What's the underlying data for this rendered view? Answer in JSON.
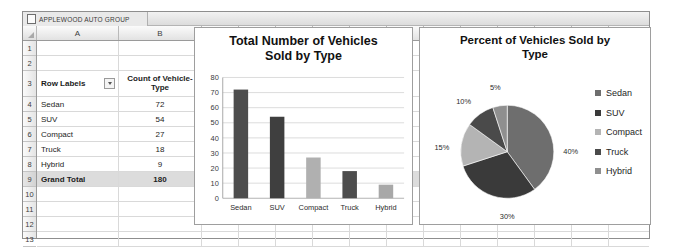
{
  "workbook": {
    "sheet_tab": {
      "label": "APPLEWOOD AUTO GROUP",
      "icon": "worksheet-icon"
    },
    "column_headers": [
      "A",
      "B",
      "C",
      "D",
      "E",
      "F",
      "G",
      "H",
      "I",
      "J",
      "K",
      "L",
      "M"
    ],
    "row_numbers": [
      "1",
      "2",
      "3",
      "4",
      "5",
      "6",
      "7",
      "8",
      "9",
      "10",
      "11",
      "12",
      "13"
    ],
    "pivot_table": {
      "header_row_number": "3",
      "col_a_header": "Row Labels",
      "col_a_filter": "filter-dropdown-icon",
      "col_b_header_line1": "Count of Vehicle-",
      "col_b_header_line2": "Type",
      "rows": [
        {
          "row": "4",
          "label": "Sedan",
          "value": "72"
        },
        {
          "row": "5",
          "label": "SUV",
          "value": "54"
        },
        {
          "row": "6",
          "label": "Compact",
          "value": "27"
        },
        {
          "row": "7",
          "label": "Truck",
          "value": "18"
        },
        {
          "row": "8",
          "label": "Hybrid",
          "value": "9"
        }
      ],
      "total": {
        "row": "9",
        "label": "Grand Total",
        "value": "180"
      }
    }
  },
  "chart_data": [
    {
      "type": "bar",
      "name": "total-vehicles-bar-chart",
      "title": "Total Number of Vehicles Sold by Type",
      "title_line1": "Total Number of Vehicles",
      "title_line2": "Sold by Type",
      "categories": [
        "Sedan",
        "SUV",
        "Compact",
        "Truck",
        "Hybrid"
      ],
      "values": [
        72,
        54,
        27,
        18,
        9
      ],
      "bar_colors": [
        "#4d4d4d",
        "#3f3f3f",
        "#b0b0b0",
        "#4d4d4d",
        "#a8a8a8"
      ],
      "xlabel": "",
      "ylabel": "",
      "ylim": [
        0,
        80
      ],
      "yticks": [
        "0",
        "10",
        "20",
        "30",
        "40",
        "50",
        "60",
        "70",
        "80"
      ],
      "grid": true,
      "legend": false
    },
    {
      "type": "pie",
      "name": "percent-vehicles-pie-chart",
      "title": "Percent of Vehicles Sold by Type",
      "title_line1": "Percent of Vehicles Sold by",
      "title_line2": "Type",
      "categories": [
        "Sedan",
        "SUV",
        "Compact",
        "Truck",
        "Hybrid"
      ],
      "values": [
        40,
        30,
        15,
        10,
        5
      ],
      "data_labels": [
        "40%",
        "30%",
        "15%",
        "10%",
        "5%"
      ],
      "slice_colors": [
        "#6e6e6e",
        "#3a3a3a",
        "#b4b4b4",
        "#4a4a4a",
        "#8f8f8f"
      ],
      "legend": true,
      "legend_position": "right",
      "legend_entries": [
        {
          "label": "Sedan",
          "color": "#6e6e6e"
        },
        {
          "label": "SUV",
          "color": "#3a3a3a"
        },
        {
          "label": "Compact",
          "color": "#b4b4b4"
        },
        {
          "label": "Truck",
          "color": "#4a4a4a"
        },
        {
          "label": "Hybrid",
          "color": "#8f8f8f"
        }
      ]
    }
  ]
}
